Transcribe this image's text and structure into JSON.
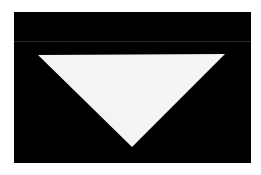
{
  "image": {
    "background": "#ffffff",
    "frame_color": "#000000",
    "shape": {
      "type": "triangle",
      "orientation": "inverted",
      "fill": "#f4f4f4"
    }
  }
}
